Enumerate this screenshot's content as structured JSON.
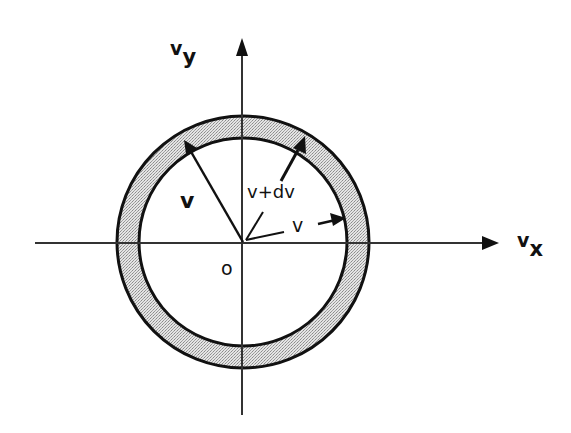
{
  "diagram": {
    "type": "velocity-space shell",
    "axes": {
      "x_label": "v",
      "x_subscript": "x",
      "y_label": "v",
      "y_subscript": "y",
      "origin_label": "o"
    },
    "vectors": [
      {
        "label": "v",
        "description": "vector from origin to inner circle (upper-left)"
      },
      {
        "label": "v+dv",
        "description": "vector from origin to outer circle (upper-right)"
      }
    ],
    "annotations": {
      "radius_label": "v",
      "shell_label": "v+dv",
      "vector_label": "v"
    },
    "colors": {
      "line": "#111111",
      "shell_fill": "#cfcfcf",
      "background": "#ffffff"
    }
  }
}
